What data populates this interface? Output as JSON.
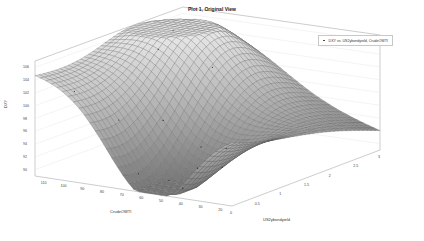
{
  "chart_data": {
    "type": "surface3d",
    "title": "Plot 1, Original View",
    "legend": [
      "DXY vs. US2ybondyield, CrudeOWTI"
    ],
    "xlabel": "US2ybondyield",
    "ylabel": "CrudeOWTI",
    "zlabel": "DXY",
    "x_ticks": [
      "0",
      "0.5",
      "1",
      "1.5",
      "2",
      "2.5",
      "3"
    ],
    "y_ticks": [
      "110",
      "100",
      "90",
      "80",
      "70",
      "60",
      "50",
      "40",
      "30",
      "20"
    ],
    "z_ticks": [
      "106",
      "104",
      "102",
      "100",
      "98",
      "96",
      "94",
      "92",
      "90"
    ],
    "xlim": [
      0,
      3
    ],
    "ylim": [
      15,
      115
    ],
    "zlim": [
      89,
      107
    ],
    "grid": true,
    "colormap": "gray mesh",
    "annotation": "z"
  },
  "figure": {
    "title": "Plot 1, Original View",
    "legend_label": "DXY vs. US2ybondyield, CrudeOWTI",
    "zlabel": "DXY",
    "xlabel": "US2ybondyield",
    "ylabel": "CrudeOWTI",
    "annotation": "z"
  }
}
